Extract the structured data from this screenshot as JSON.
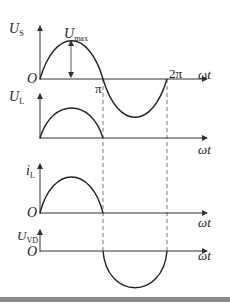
{
  "figure": {
    "x_axis_label": "ωt",
    "origin_label": "O",
    "ticks": {
      "pi": "π",
      "two_pi": "2π"
    },
    "panels": [
      {
        "id": "us",
        "var": "U",
        "sub": "S",
        "waveform": "full sine (positive 0→π, negative π→2π)",
        "annotation": {
          "var": "U",
          "sub": "max"
        }
      },
      {
        "id": "ul",
        "var": "U",
        "sub": "L",
        "waveform": "positive half-sine 0→π"
      },
      {
        "id": "il",
        "var": "i",
        "sub": "L",
        "waveform": "positive half-sine 0→π"
      },
      {
        "id": "uvd",
        "var": "U",
        "sub": "VD",
        "waveform": "negative half-sine π→2π"
      }
    ],
    "colors": {
      "curve": "#222222",
      "axis": "#333333",
      "dash": "#555555",
      "bar": "#8a8a8a"
    }
  }
}
